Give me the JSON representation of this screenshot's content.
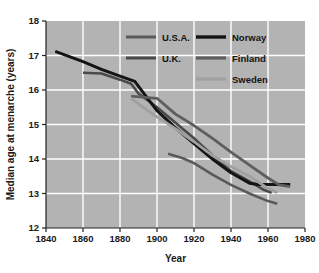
{
  "chart_data": {
    "type": "line",
    "title": "",
    "xlabel": "Year",
    "ylabel": "Median age at menarche (years)",
    "xlim": [
      1840,
      1980
    ],
    "ylim": [
      12,
      18
    ],
    "xticks": [
      1840,
      1860,
      1880,
      1900,
      1920,
      1940,
      1960,
      1980
    ],
    "yticks": [
      12,
      13,
      14,
      15,
      16,
      17,
      18
    ],
    "grid": true,
    "legend_position": "upper right",
    "plot_background": "#b3b3b3",
    "grid_color": "#ffffff",
    "series": [
      {
        "name": "U.S.A.",
        "color": "#5a5a5a",
        "width": 2.6,
        "points": [
          [
            1906,
            14.15
          ],
          [
            1914,
            14.02
          ],
          [
            1920,
            13.88
          ],
          [
            1930,
            13.55
          ],
          [
            1940,
            13.25
          ],
          [
            1950,
            13.0
          ],
          [
            1960,
            12.78
          ],
          [
            1965,
            12.7
          ]
        ]
      },
      {
        "name": "U.K.",
        "color": "#4a4a4a",
        "width": 2.6,
        "points": [
          [
            1860,
            16.5
          ],
          [
            1870,
            16.48
          ],
          [
            1880,
            16.3
          ],
          [
            1886,
            16.18
          ],
          [
            1890,
            15.9
          ],
          [
            1900,
            15.5
          ],
          [
            1910,
            15.05
          ],
          [
            1920,
            14.6
          ],
          [
            1930,
            14.1
          ],
          [
            1940,
            13.65
          ],
          [
            1950,
            13.35
          ],
          [
            1958,
            13.1
          ],
          [
            1962,
            13.02
          ]
        ]
      },
      {
        "name": "Norway",
        "color": "#141414",
        "width": 3.0,
        "points": [
          [
            1845,
            17.12
          ],
          [
            1860,
            16.82
          ],
          [
            1870,
            16.6
          ],
          [
            1880,
            16.4
          ],
          [
            1888,
            16.25
          ],
          [
            1895,
            15.75
          ],
          [
            1900,
            15.4
          ],
          [
            1910,
            14.9
          ],
          [
            1920,
            14.45
          ],
          [
            1930,
            14.0
          ],
          [
            1940,
            13.6
          ],
          [
            1950,
            13.3
          ],
          [
            1955,
            13.26
          ],
          [
            1972,
            13.26
          ]
        ]
      },
      {
        "name": "Finland",
        "color": "#5e5e5e",
        "width": 2.8,
        "points": [
          [
            1886,
            15.82
          ],
          [
            1895,
            15.78
          ],
          [
            1900,
            15.76
          ],
          [
            1910,
            15.3
          ],
          [
            1920,
            14.97
          ],
          [
            1930,
            14.6
          ],
          [
            1940,
            14.2
          ],
          [
            1950,
            13.82
          ],
          [
            1960,
            13.45
          ],
          [
            1966,
            13.25
          ],
          [
            1972,
            13.2
          ]
        ]
      },
      {
        "name": "Sweden",
        "color": "#a0a0a0",
        "width": 2.8,
        "points": [
          [
            1886,
            15.76
          ],
          [
            1895,
            15.4
          ],
          [
            1900,
            15.22
          ],
          [
            1910,
            14.88
          ],
          [
            1920,
            14.5
          ],
          [
            1930,
            14.1
          ],
          [
            1940,
            13.78
          ],
          [
            1950,
            13.5
          ],
          [
            1960,
            13.15
          ],
          [
            1965,
            13.02
          ]
        ]
      }
    ]
  },
  "legend": {
    "entries": [
      {
        "label": "U.S.A.",
        "col": 0,
        "row": 0
      },
      {
        "label": "U.K.",
        "col": 0,
        "row": 1
      },
      {
        "label": "Norway",
        "col": 1,
        "row": 0
      },
      {
        "label": "Finland",
        "col": 1,
        "row": 1
      },
      {
        "label": "Sweden",
        "col": 1,
        "row": 2
      }
    ]
  },
  "axes": {
    "x_title": "Year",
    "y_title": "Median age at menarche (years)",
    "x_tick_labels": [
      "1840",
      "1860",
      "1880",
      "1900",
      "1920",
      "1940",
      "1960",
      "1980"
    ],
    "y_tick_labels": [
      "12",
      "13",
      "14",
      "15",
      "16",
      "17",
      "18"
    ]
  }
}
